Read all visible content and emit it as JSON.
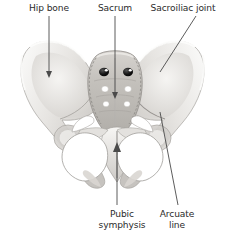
{
  "figure": {
    "kind": "anatomical-illustration",
    "background_color": "#ffffff",
    "label_color": "#2b2b2b",
    "leader_color": "#4a4a4a",
    "bone_light": "#f4f3f1",
    "bone_mid": "#d8d6d3",
    "bone_shadow": "#b3b0ac",
    "foramen_dark": "#1a1a1a",
    "foramen_light": "#ffffff"
  },
  "labels": [
    {
      "id": "hip-bone",
      "text": "Hip bone",
      "text2": "",
      "x": 49,
      "y": 3,
      "position": "top"
    },
    {
      "id": "sacrum",
      "text": "Sacrum",
      "text2": "",
      "x": 115,
      "y": 3,
      "position": "top"
    },
    {
      "id": "sacroiliac-joint",
      "text": "Sacroiliac joint",
      "text2": "",
      "x": 183,
      "y": 3,
      "position": "top"
    },
    {
      "id": "pubic-symphysis",
      "text": "Pubic",
      "text2": "symphysis",
      "x": 122,
      "y": 209,
      "position": "bottom"
    },
    {
      "id": "arcuate-line",
      "text": "Arcuate",
      "text2": "line",
      "x": 177,
      "y": 209,
      "position": "bottom"
    }
  ],
  "leaders": [
    {
      "id": "leader-hip-bone",
      "x1": 49,
      "y1": 16,
      "x2": 49,
      "y2": 75,
      "arrow": "down"
    },
    {
      "id": "leader-sacrum",
      "x1": 115,
      "y1": 16,
      "x2": 115,
      "y2": 96,
      "arrow": "down"
    },
    {
      "id": "leader-sacroiliac-joint",
      "x1": 196,
      "y1": 16,
      "x2": 160,
      "y2": 72,
      "arrow": "none"
    },
    {
      "id": "leader-pubic-symphysis",
      "x1": 117,
      "y1": 205,
      "x2": 117,
      "y2": 144,
      "arrow": "up"
    },
    {
      "id": "leader-arcuate-line",
      "x1": 178,
      "y1": 205,
      "x2": 160,
      "y2": 112,
      "arrow": "none"
    }
  ],
  "structures": [
    {
      "id": "left-ilium",
      "name": "Left iliac wing"
    },
    {
      "id": "right-ilium",
      "name": "Right iliac wing"
    },
    {
      "id": "sacrum-body",
      "name": "Sacrum"
    },
    {
      "id": "coccyx",
      "name": "Coccyx"
    },
    {
      "id": "left-obturator",
      "name": "Left obturator foramen"
    },
    {
      "id": "right-obturator",
      "name": "Right obturator foramen"
    },
    {
      "id": "pubic-symphysis-joint",
      "name": "Pubic symphysis"
    },
    {
      "id": "left-acetabulum",
      "name": "Left acetabulum"
    },
    {
      "id": "right-acetabulum",
      "name": "Right acetabulum"
    }
  ],
  "sacral_foramina": [
    {
      "row": 1,
      "side": "left",
      "cx": 104,
      "cy": 72,
      "rx": 5.0,
      "ry": 4.2,
      "fill": "dark"
    },
    {
      "row": 1,
      "side": "right",
      "cx": 128,
      "cy": 72,
      "rx": 5.0,
      "ry": 4.2,
      "fill": "dark"
    },
    {
      "row": 2,
      "side": "left",
      "cx": 105,
      "cy": 89,
      "rx": 3.4,
      "ry": 3.0,
      "fill": "light"
    },
    {
      "row": 2,
      "side": "right",
      "cx": 128,
      "cy": 89,
      "rx": 3.4,
      "ry": 3.0,
      "fill": "light"
    },
    {
      "row": 3,
      "side": "left",
      "cx": 106,
      "cy": 104,
      "rx": 3.1,
      "ry": 2.7,
      "fill": "light"
    },
    {
      "row": 3,
      "side": "right",
      "cx": 127,
      "cy": 104,
      "rx": 3.1,
      "ry": 2.7,
      "fill": "light"
    }
  ]
}
